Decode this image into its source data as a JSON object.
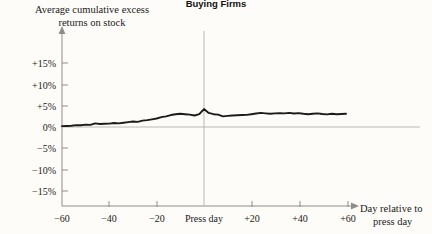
{
  "chart_data": {
    "type": "line",
    "title": "Buying Firms",
    "ylabel_line1": "Average cumulative excess",
    "ylabel_line2": "returns on stock",
    "xlabel_line1": "Day relative to",
    "xlabel_line2": "press day",
    "xlabel": "Day relative to press day",
    "ylabel": "Average cumulative excess returns on stock",
    "grid": false,
    "legend": "none",
    "ylim": [
      -17.5,
      17.5
    ],
    "xlim": [
      -62,
      62
    ],
    "yticks": [
      15,
      10,
      5,
      0,
      -5,
      -10,
      -15
    ],
    "ytick_labels": [
      "+15%",
      "+10%",
      "+5%",
      "0%",
      "−5%",
      "−10%",
      "−15%"
    ],
    "xticks": [
      -60,
      -40,
      -20,
      0,
      20,
      40,
      60
    ],
    "xtick_labels": [
      "−60",
      "−40",
      "−20",
      "Press day",
      "+20",
      "+40",
      "+60"
    ],
    "zero_reference_line": 0,
    "event_marker_x": 0,
    "event_marker_label": "Press day",
    "series": [
      {
        "name": "Average cumulative excess returns on stock",
        "color": "#1b1b1b",
        "x": [
          -60,
          -58,
          -56,
          -54,
          -52,
          -50,
          -48,
          -46,
          -44,
          -42,
          -40,
          -38,
          -36,
          -34,
          -32,
          -30,
          -28,
          -26,
          -24,
          -22,
          -20,
          -18,
          -16,
          -14,
          -12,
          -10,
          -8,
          -6,
          -4,
          -2,
          0,
          2,
          4,
          6,
          8,
          10,
          12,
          14,
          16,
          18,
          20,
          22,
          24,
          26,
          28,
          30,
          32,
          34,
          36,
          38,
          40,
          42,
          44,
          46,
          48,
          50,
          52,
          54,
          56,
          58,
          60
        ],
        "values": [
          0.2,
          0.25,
          0.3,
          0.45,
          0.4,
          0.55,
          0.5,
          0.85,
          0.7,
          0.75,
          0.8,
          0.95,
          0.85,
          1.0,
          1.15,
          1.3,
          1.2,
          1.5,
          1.6,
          1.8,
          2.0,
          2.3,
          2.5,
          2.8,
          3.0,
          3.1,
          3.0,
          2.9,
          2.7,
          3.0,
          4.2,
          3.3,
          3.0,
          2.9,
          2.5,
          2.6,
          2.7,
          2.75,
          2.8,
          2.85,
          3.0,
          3.15,
          3.3,
          3.2,
          3.1,
          3.2,
          3.25,
          3.2,
          3.3,
          3.15,
          3.25,
          3.1,
          3.0,
          3.1,
          3.2,
          3.05,
          2.95,
          3.1,
          3.0,
          3.05,
          3.1
        ]
      }
    ]
  }
}
